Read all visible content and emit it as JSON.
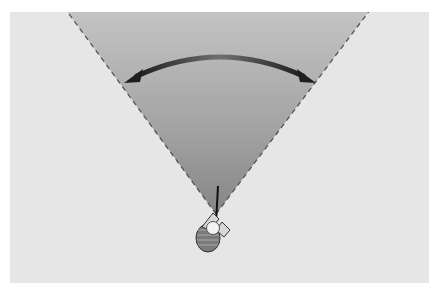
{
  "diagram": {
    "colors": {
      "background": "#e6e6e6",
      "cone_top": "#bdbdbd",
      "cone_bottom": "#8a8a8a",
      "dashed_line": "#555555",
      "arrow": "#3a3a3a"
    },
    "cone": {
      "apex": [
        216,
        214
      ],
      "left_top": [
        68,
        14
      ],
      "right_top": [
        368,
        14
      ]
    },
    "arrow": {
      "type": "double-headed-curve",
      "start": [
        125,
        83
      ],
      "end": [
        315,
        83
      ]
    },
    "figure": "golfer-top-view"
  }
}
